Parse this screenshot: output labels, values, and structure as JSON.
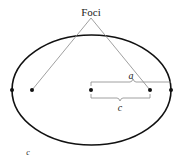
{
  "diagram": {
    "title_label": "Foci",
    "labels": {
      "semi_major": "a",
      "focal_distance": "c",
      "stray_label": "c"
    },
    "ellipse": {
      "cx": 91.5,
      "cy": 90,
      "rx": 79.5,
      "ry": 55,
      "stroke": "#111111"
    },
    "points": [
      {
        "name": "left-vertex",
        "x": 12,
        "y": 90
      },
      {
        "name": "left-focus",
        "x": 32,
        "y": 90
      },
      {
        "name": "center",
        "x": 91,
        "y": 90
      },
      {
        "name": "right-focus",
        "x": 150,
        "y": 90
      },
      {
        "name": "right-vertex",
        "x": 171,
        "y": 90
      }
    ],
    "colors": {
      "line": "#888888",
      "ink": "#111111"
    }
  }
}
